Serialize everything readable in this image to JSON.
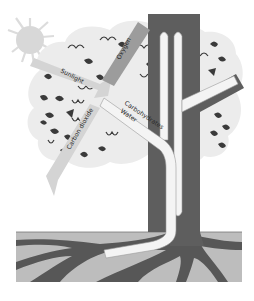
{
  "diagram": {
    "labels": {
      "sunlight": "Sunlight",
      "oxygen": "Oxygen",
      "carbon_dioxide": "Carbon dioxide",
      "carbohydrates": "Carbohydrates",
      "water": "Water"
    },
    "colors": {
      "background": "#ffffff",
      "canopy": "#eaeaea",
      "sun": "#dadada",
      "arrow_light": "#d2d2d2",
      "arrow_oxygen": "#9a9a9a",
      "trunk": "#5c5c5c",
      "soil": "#bdbdbd",
      "roots": "#5a5a5a",
      "vessel": "#f4f4f4",
      "leaf": "#3a3a3a"
    }
  }
}
